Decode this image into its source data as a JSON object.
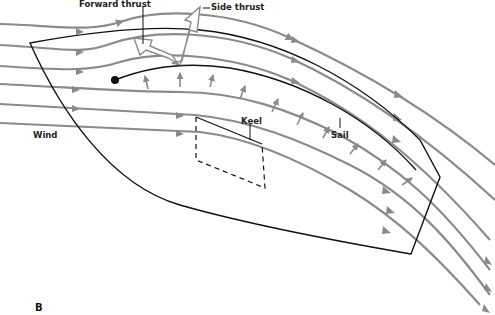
{
  "diagram": {
    "panel_letter": "B",
    "labels": {
      "forward_thrust": "Forward thrust",
      "side_thrust": "Side thrust",
      "wind": "Wind",
      "keel": "Keel",
      "sail": "Sail"
    },
    "colors": {
      "streamline": "#8a8a8a",
      "outline": "#111111",
      "thrust_arrow_fill": "#ffffff",
      "thrust_arrow_stroke": "#8a8a8a"
    },
    "elements": [
      "wind streamlines",
      "boat hull outline",
      "sail curve",
      "pressure arrows",
      "keel (dashed)",
      "forward thrust arrow",
      "side thrust arrow"
    ]
  }
}
